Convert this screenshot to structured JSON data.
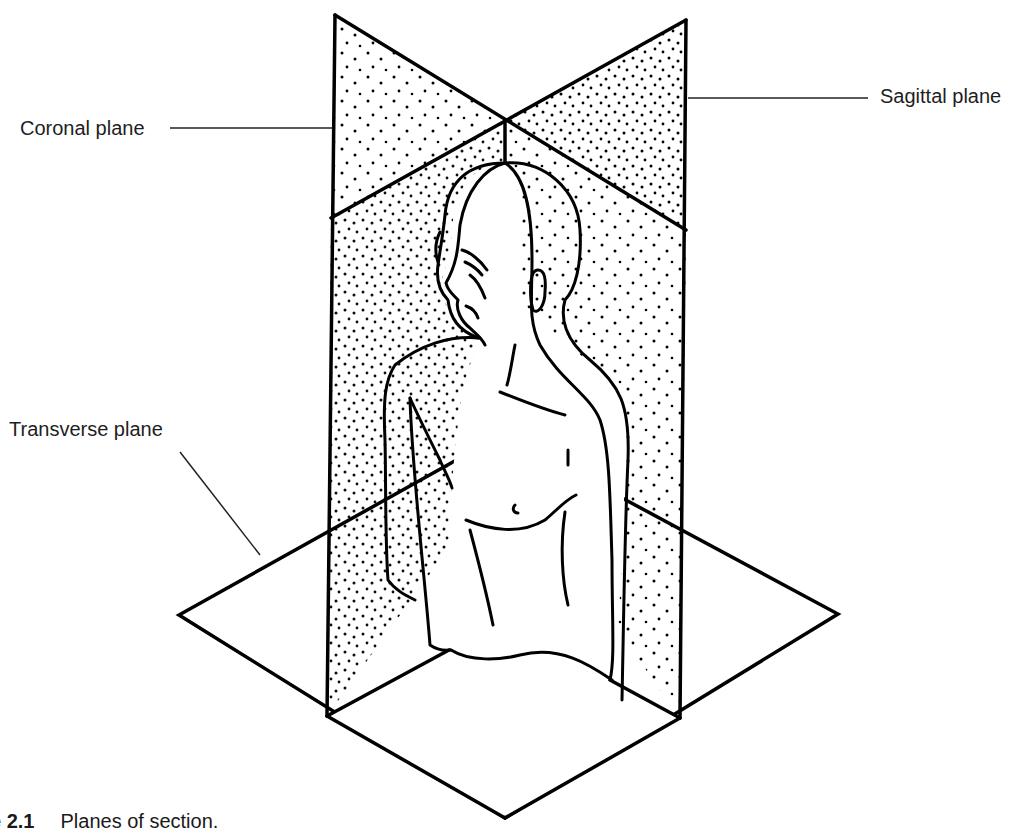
{
  "figure": {
    "caption_number": "e 2.1",
    "caption_text": "Planes of section.",
    "labels": {
      "coronal": "Coronal plane",
      "sagittal": "Sagittal plane",
      "transverse": "Transverse plane"
    },
    "colors": {
      "line": "#000000",
      "stipple": "#000000",
      "background": "#ffffff",
      "text": "#1e1e1e"
    }
  }
}
